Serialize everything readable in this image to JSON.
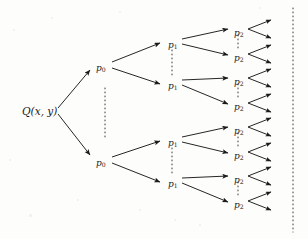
{
  "figure": {
    "name": "binary-expansion-tree",
    "background_color": "#fdfdfc",
    "stroke_color": "#1a1a1a",
    "width": 308,
    "height": 239
  },
  "nodes": {
    "root": {
      "label": "Q(x, y)",
      "x": 22,
      "y": 106
    },
    "level0": [
      {
        "label": "p",
        "sub": "0",
        "x": 96,
        "y": 64
      },
      {
        "label": "p",
        "sub": "0",
        "x": 96,
        "y": 159
      }
    ],
    "level1": [
      {
        "label": "p",
        "sub": "1",
        "x": 168,
        "y": 41
      },
      {
        "label": "p",
        "sub": "1",
        "x": 168,
        "y": 82
      },
      {
        "label": "p",
        "sub": "1",
        "x": 168,
        "y": 139
      },
      {
        "label": "p",
        "sub": "1",
        "x": 168,
        "y": 180
      }
    ],
    "level2": [
      {
        "label": "p",
        "sub": "2",
        "x": 234,
        "y": 29
      },
      {
        "label": "p",
        "sub": "2",
        "x": 234,
        "y": 54
      },
      {
        "label": "p",
        "sub": "2",
        "x": 234,
        "y": 78
      },
      {
        "label": "p",
        "sub": "2",
        "x": 234,
        "y": 103
      },
      {
        "label": "p",
        "sub": "2",
        "x": 234,
        "y": 127
      },
      {
        "label": "p",
        "sub": "2",
        "x": 234,
        "y": 152
      },
      {
        "label": "p",
        "sub": "2",
        "x": 234,
        "y": 176
      },
      {
        "label": "p",
        "sub": "2",
        "x": 234,
        "y": 201
      }
    ]
  },
  "edges": {
    "root_to_level0": [
      {
        "x1": 58,
        "y1": 108,
        "x2": 90,
        "y2": 70
      },
      {
        "x1": 58,
        "y1": 114,
        "x2": 90,
        "y2": 155
      }
    ],
    "level0_to_level1": [
      {
        "x1": 112,
        "y1": 62,
        "x2": 160,
        "y2": 43
      },
      {
        "x1": 112,
        "y1": 68,
        "x2": 160,
        "y2": 84
      },
      {
        "x1": 112,
        "y1": 157,
        "x2": 160,
        "y2": 141
      },
      {
        "x1": 112,
        "y1": 163,
        "x2": 160,
        "y2": 182
      }
    ],
    "level1_to_level2": [
      {
        "x1": 182,
        "y1": 39,
        "x2": 228,
        "y2": 29
      },
      {
        "x1": 182,
        "y1": 44,
        "x2": 228,
        "y2": 55
      },
      {
        "x1": 182,
        "y1": 80,
        "x2": 228,
        "y2": 78
      },
      {
        "x1": 182,
        "y1": 85,
        "x2": 228,
        "y2": 104
      },
      {
        "x1": 182,
        "y1": 137,
        "x2": 228,
        "y2": 127
      },
      {
        "x1": 182,
        "y1": 142,
        "x2": 228,
        "y2": 153
      },
      {
        "x1": 182,
        "y1": 178,
        "x2": 228,
        "y2": 176
      },
      {
        "x1": 182,
        "y1": 183,
        "x2": 228,
        "y2": 202
      }
    ],
    "level2_to_leaves": [
      {
        "x1": 248,
        "y1": 29,
        "x2": 271,
        "y2": 20
      },
      {
        "x1": 248,
        "y1": 29,
        "x2": 271,
        "y2": 38
      },
      {
        "x1": 248,
        "y1": 54,
        "x2": 271,
        "y2": 45
      },
      {
        "x1": 248,
        "y1": 54,
        "x2": 271,
        "y2": 63
      },
      {
        "x1": 248,
        "y1": 78,
        "x2": 271,
        "y2": 69
      },
      {
        "x1": 248,
        "y1": 78,
        "x2": 271,
        "y2": 87
      },
      {
        "x1": 248,
        "y1": 103,
        "x2": 271,
        "y2": 94
      },
      {
        "x1": 248,
        "y1": 103,
        "x2": 271,
        "y2": 112
      },
      {
        "x1": 248,
        "y1": 127,
        "x2": 271,
        "y2": 118
      },
      {
        "x1": 248,
        "y1": 127,
        "x2": 271,
        "y2": 136
      },
      {
        "x1": 248,
        "y1": 152,
        "x2": 271,
        "y2": 143
      },
      {
        "x1": 248,
        "y1": 152,
        "x2": 271,
        "y2": 161
      },
      {
        "x1": 248,
        "y1": 176,
        "x2": 271,
        "y2": 167
      },
      {
        "x1": 248,
        "y1": 176,
        "x2": 271,
        "y2": 185
      },
      {
        "x1": 248,
        "y1": 201,
        "x2": 271,
        "y2": 192
      },
      {
        "x1": 248,
        "y1": 201,
        "x2": 271,
        "y2": 210
      }
    ]
  },
  "ellipses": {
    "description": "vertical dotted ellipsis marks indicating omitted sibling branches",
    "vertical_dotted": [
      {
        "name": "ellipsis-between-p0",
        "x": 105,
        "y1": 88,
        "y2": 138
      },
      {
        "name": "ellipsis-between-p1-upper",
        "x": 172,
        "y1": 50,
        "y2": 75
      },
      {
        "name": "ellipsis-between-p1-lower",
        "x": 172,
        "y1": 148,
        "y2": 173
      },
      {
        "name": "ellipsis-between-p2-1",
        "x": 238,
        "y1": 35,
        "y2": 48
      },
      {
        "name": "ellipsis-between-p2-2",
        "x": 238,
        "y1": 84,
        "y2": 97
      },
      {
        "name": "ellipsis-between-p2-3",
        "x": 238,
        "y1": 133,
        "y2": 146
      },
      {
        "name": "ellipsis-between-p2-4",
        "x": 238,
        "y1": 182,
        "y2": 195
      }
    ],
    "right_boundary": {
      "name": "right-dotted-boundary",
      "x": 293,
      "y1": 8,
      "y2": 232
    }
  },
  "specks": [
    {
      "x": 14,
      "y": 30,
      "r": 1.4
    },
    {
      "x": 52,
      "y": 18,
      "r": 1.1
    },
    {
      "x": 120,
      "y": 12,
      "r": 1.3
    },
    {
      "x": 78,
      "y": 200,
      "r": 1.2
    },
    {
      "x": 30,
      "y": 215,
      "r": 1.5
    },
    {
      "x": 200,
      "y": 225,
      "r": 1.1
    },
    {
      "x": 260,
      "y": 8,
      "r": 1.2
    },
    {
      "x": 140,
      "y": 210,
      "r": 1.0
    },
    {
      "x": 10,
      "y": 160,
      "r": 1.1
    },
    {
      "x": 175,
      "y": 220,
      "r": 1.3
    }
  ]
}
